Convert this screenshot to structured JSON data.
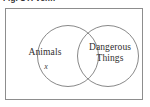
{
  "figure": {
    "caption_fragment": "Fig. 1 A Venn",
    "type": "venn-diagram",
    "frame": {
      "visible": true,
      "border_color": "#8d8d8d",
      "background_color": "#ffffff"
    },
    "circle_stroke_color": "#7a7a7a",
    "text_color": "#2e2e2e"
  },
  "diagram": {
    "sets": [
      {
        "id": "animals",
        "label": "Animals",
        "position": "left",
        "cx": 63,
        "cy": 48,
        "r": 30.5
      },
      {
        "id": "dangerous-things",
        "label": "Dangerous\nThings",
        "position": "right",
        "cx": 103,
        "cy": 48,
        "r": 30.5
      }
    ],
    "elements": [
      {
        "id": "x",
        "label": "x",
        "style": "italic",
        "region": "animals-only"
      }
    ]
  }
}
